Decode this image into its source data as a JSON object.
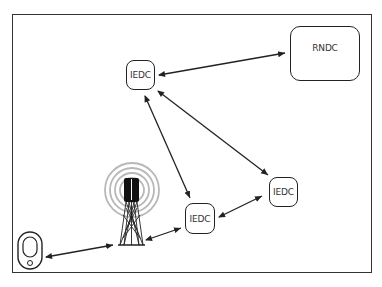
{
  "diagram": {
    "type": "network-topology",
    "nodes": [
      {
        "id": "rndc",
        "label": "RNDC",
        "kind": "regional-data-center"
      },
      {
        "id": "iedc_top",
        "label": "IEDC",
        "kind": "edge-data-center"
      },
      {
        "id": "iedc_mid",
        "label": "IEDC",
        "kind": "edge-data-center"
      },
      {
        "id": "iedc_right",
        "label": "IEDC",
        "kind": "edge-data-center"
      },
      {
        "id": "tower",
        "label": "",
        "kind": "cell-tower"
      },
      {
        "id": "device",
        "label": "",
        "kind": "mobile-device"
      }
    ],
    "edges": [
      {
        "from": "iedc_top",
        "to": "rndc",
        "bidirectional": true
      },
      {
        "from": "iedc_top",
        "to": "iedc_mid",
        "bidirectional": true
      },
      {
        "from": "iedc_top",
        "to": "iedc_right",
        "bidirectional": true
      },
      {
        "from": "iedc_mid",
        "to": "iedc_right",
        "bidirectional": true
      },
      {
        "from": "tower",
        "to": "iedc_mid",
        "bidirectional": true
      },
      {
        "from": "device",
        "to": "tower",
        "bidirectional": true
      }
    ],
    "colors": {
      "stroke": "#222222",
      "signal_rings": "#b5b5b5",
      "frame": "#333333"
    }
  }
}
